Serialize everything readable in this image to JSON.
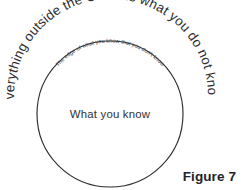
{
  "figure": {
    "caption": "Figure 7",
    "background_color": "#ffffff",
    "stroke_color": "#2e2e32",
    "text_color": "#2c2c30"
  },
  "diagram": {
    "type": "venn-single-circle",
    "circle": {
      "center_x": 110,
      "center_y": 114,
      "radius": 73,
      "label": "What you know"
    },
    "outer_arc_label": "Everything outside the Circle is what you do not know.",
    "inner_arc_label": "The edge of what you know that you don't know"
  }
}
